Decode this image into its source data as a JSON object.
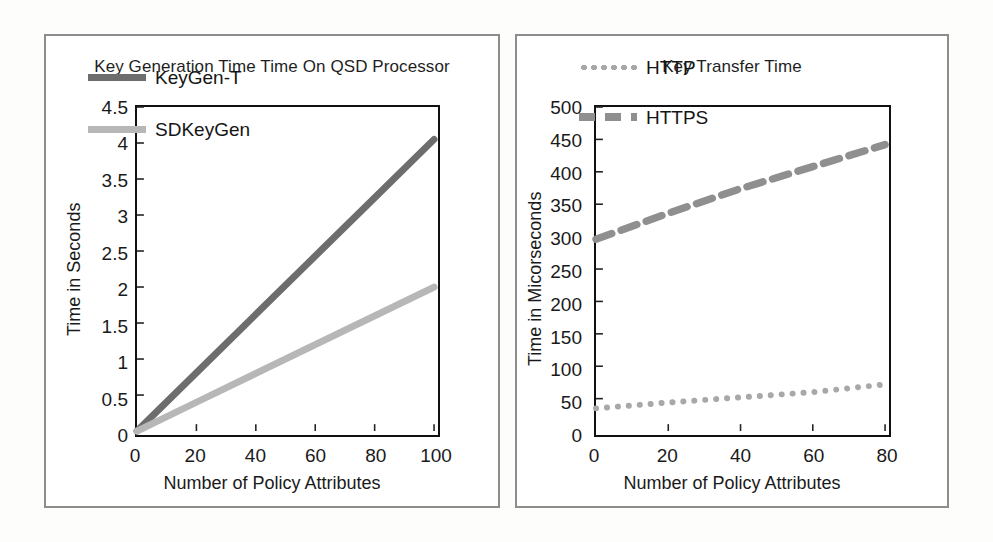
{
  "figure": {
    "panels": [
      "key-generation-time",
      "key-transfer-time"
    ]
  },
  "chart_data": [
    {
      "type": "line",
      "title": "Key Generation Time Time  On QSD Processor",
      "xlabel": "Number of  Policy Attributes",
      "ylabel": "Time in Seconds",
      "x": [
        0,
        20,
        40,
        60,
        80,
        100
      ],
      "xlim": [
        0,
        100
      ],
      "ylim": [
        0,
        4.5
      ],
      "xticks": [
        "0",
        "20",
        "40",
        "60",
        "80",
        "100"
      ],
      "yticks": [
        "0",
        "0.5",
        "1",
        "1.5",
        "2",
        "2.5",
        "3",
        "3.5",
        "4",
        "4.5"
      ],
      "grid": false,
      "legend_position": "upper-left-inside",
      "series": [
        {
          "name": "KeyGen-T",
          "values": [
            0,
            0.81,
            1.62,
            2.43,
            3.24,
            4.05
          ],
          "color": "#6d6d6d",
          "style": "solid"
        },
        {
          "name": "SDKeyGen",
          "values": [
            0,
            0.4,
            0.8,
            1.2,
            1.6,
            2.0
          ],
          "color": "#b7b7b7",
          "style": "solid"
        }
      ]
    },
    {
      "type": "line",
      "title": "Key Transfer Time",
      "xlabel": "Number of  Policy Attributes",
      "ylabel": "Time in Micorseconds",
      "x": [
        0,
        20,
        40,
        60,
        80
      ],
      "xlim": [
        0,
        80
      ],
      "ylim": [
        0,
        500
      ],
      "xticks": [
        "0",
        "20",
        "40",
        "60",
        "80"
      ],
      "yticks": [
        "0",
        "50",
        "100",
        "150",
        "200",
        "250",
        "300",
        "350",
        "400",
        "450",
        "500"
      ],
      "grid": false,
      "legend_position": "upper-left-inside",
      "series": [
        {
          "name": "HTTP",
          "values": [
            35,
            44,
            52,
            60,
            72
          ],
          "color": "#a8a8a8",
          "style": "dotted"
        },
        {
          "name": "HTTPS",
          "values": [
            296,
            336,
            374,
            408,
            442
          ],
          "color": "#8f8f8f",
          "style": "dashed"
        }
      ]
    }
  ]
}
